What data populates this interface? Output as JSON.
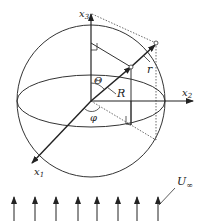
{
  "diagram": {
    "axes": {
      "x1": {
        "label": "x",
        "sub": "1"
      },
      "x2": {
        "label": "x",
        "sub": "2"
      },
      "x3": {
        "label": "x",
        "sub": "3"
      }
    },
    "labels": {
      "theta": "Θ",
      "phi": "φ",
      "R": "R",
      "r": "r",
      "U": "U",
      "U_sub": "∞"
    },
    "flow_arrows": {
      "count": 8,
      "x_positions": [
        14,
        35,
        56,
        78,
        97,
        118,
        137,
        158
      ]
    },
    "colors": {
      "line": "#222222",
      "background": "#ffffff"
    }
  }
}
